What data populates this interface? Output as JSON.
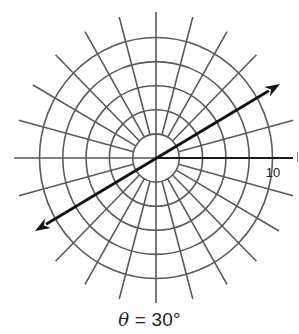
{
  "figure": {
    "caption": {
      "symbol": "θ",
      "text": " = 30°"
    },
    "polar_grid": {
      "center": {
        "x": 156,
        "y": 158
      },
      "ring_count": 5,
      "ring_radius_units": [
        2,
        4,
        6,
        8,
        10
      ],
      "ring_spacing_px_x": 23.3,
      "ring_spacing_px_y": 24.1,
      "spoke_angle_step_deg": 15,
      "spoke_outer_radius_px_x": 142,
      "spoke_outer_radius_px_y": 146,
      "axis_left_end_x": 14,
      "axis_right_end_x": 293,
      "axis_top_end_y": 12,
      "axis_bottom_end_y": 303,
      "radial_label": "10",
      "grid_color": "#5a5a5a",
      "axis_color": "#1a1a1a"
    },
    "line": {
      "angle_deg": 30,
      "label": "θ = 30°",
      "start": {
        "x": 35,
        "y": 231
      },
      "end": {
        "x": 280,
        "y": 84
      },
      "arrowheads": "both",
      "color": "#111111"
    }
  }
}
